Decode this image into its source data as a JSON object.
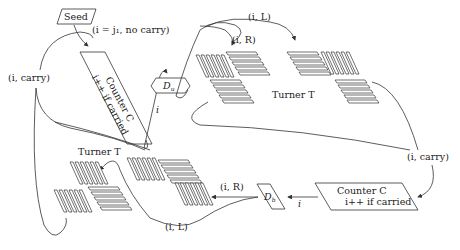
{
  "diagram": {
    "type": "flow-diagram",
    "nodes": {
      "seed": {
        "label": "Seed"
      },
      "counter_top": {
        "title": "Counter C",
        "subtitle": "i++ if carried"
      },
      "du": {
        "label": "D",
        "sub": "u"
      },
      "turner_top": {
        "label": "Turner T"
      },
      "counter_bottom": {
        "title": "Counter C",
        "subtitle": "i++ if carried"
      },
      "db": {
        "label": "D",
        "sub": "b"
      },
      "turner_bottom": {
        "label": "Turner T"
      }
    },
    "edge_labels": {
      "seed_to_counter": "(i = j₁, no carry)",
      "loop_left": "(i, carry)",
      "counter_to_du": "i",
      "top_L": "(i, L)",
      "top_R": "(i, R)",
      "right_carry": "(i, carry)",
      "counter_to_db": "i",
      "bottom_R": "(i, R)",
      "bottom_L": "(i, L)"
    },
    "colors": {
      "stroke": "#333333",
      "background": "#ffffff",
      "text": "#222222"
    }
  }
}
